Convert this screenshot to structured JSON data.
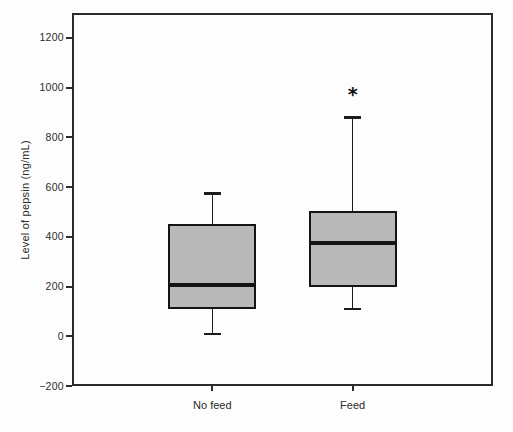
{
  "figure": {
    "background": "#fdfdfd",
    "frame_color": "#2b2b2b"
  },
  "chart_data": {
    "type": "boxplot",
    "title": "",
    "xlabel": "",
    "ylabel": "Level of pepsin (ng/mL)",
    "categories": [
      "No feed",
      "Feed"
    ],
    "ylim": [
      -200,
      1300
    ],
    "yticks": [
      -200,
      0,
      200,
      400,
      600,
      800,
      1000,
      1200
    ],
    "grid": false,
    "legend": "none",
    "box_fill": "#b9b9b9",
    "box_edge": "#141414",
    "series": [
      {
        "name": "No feed",
        "whisker_low": 10,
        "q1": 110,
        "median": 205,
        "q3": 450,
        "whisker_high": 575,
        "annotation": ""
      },
      {
        "name": "Feed",
        "whisker_low": 110,
        "q1": 200,
        "median": 375,
        "q3": 505,
        "whisker_high": 880,
        "annotation": "*"
      }
    ]
  }
}
